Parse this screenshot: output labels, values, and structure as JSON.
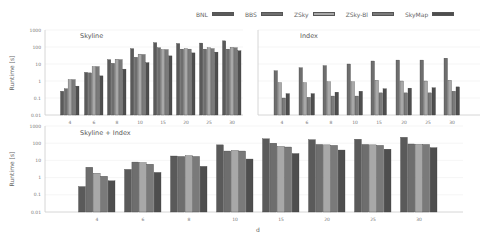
{
  "legend": [
    {
      "name": "BNL",
      "color": "#5a5a5a"
    },
    {
      "name": "BBS",
      "color": "#6e6e6e"
    },
    {
      "name": "ZSky",
      "color": "#a8a8a8"
    },
    {
      "name": "ZSky-Bl",
      "color": "#7a7a7a"
    },
    {
      "name": "SkyMap",
      "color": "#4e4e4e"
    }
  ],
  "chart_data": [
    {
      "type": "bar",
      "title": "Skyline",
      "xlabel": "",
      "ylabel": "Runtime [s]",
      "yscale": "log",
      "ylim": [
        0.01,
        1000
      ],
      "yticks": [
        "1000",
        "100",
        "10",
        "1",
        "0.1",
        "0.01"
      ],
      "grid": true,
      "categories": [
        "4",
        "6",
        "8",
        "10",
        "15",
        "20",
        "25",
        "30"
      ],
      "series": [
        {
          "name": "BNL",
          "values": [
            0.25,
            3.2,
            18,
            80,
            180,
            160,
            170,
            230
          ]
        },
        {
          "name": "BBS",
          "values": [
            0.35,
            3.0,
            11,
            25,
            90,
            75,
            75,
            75
          ]
        },
        {
          "name": "ZSky",
          "values": [
            1.2,
            7,
            19,
            38,
            70,
            80,
            90,
            95
          ]
        },
        {
          "name": "ZSky-Bl",
          "values": [
            1.2,
            7,
            18,
            36,
            70,
            75,
            80,
            90
          ]
        },
        {
          "name": "SkyMap",
          "values": [
            0.5,
            2,
            5,
            12,
            30,
            45,
            50,
            60
          ]
        }
      ]
    },
    {
      "type": "bar",
      "title": "Index",
      "xlabel": "",
      "ylabel": "",
      "yscale": "log",
      "ylim": [
        0.01,
        1000
      ],
      "grid": true,
      "categories": [
        "4",
        "6",
        "8",
        "10",
        "15",
        "20",
        "25",
        "30"
      ],
      "series": [
        {
          "name": "BBS",
          "values": [
            4,
            6,
            8,
            10,
            15,
            17,
            17,
            22
          ]
        },
        {
          "name": "ZSky",
          "values": [
            0.8,
            0.8,
            0.9,
            0.9,
            1.1,
            1.0,
            1.0,
            1.1
          ]
        },
        {
          "name": "ZSky-Bl",
          "values": [
            0.1,
            0.11,
            0.13,
            0.13,
            0.2,
            0.2,
            0.2,
            0.25
          ]
        },
        {
          "name": "SkyMap",
          "values": [
            0.18,
            0.18,
            0.22,
            0.25,
            0.35,
            0.38,
            0.4,
            0.45
          ]
        }
      ]
    },
    {
      "type": "bar",
      "title": "Skyline + Index",
      "xlabel": "d",
      "ylabel": "Runtime [s]",
      "yscale": "log",
      "ylim": [
        0.01,
        1000
      ],
      "yticks": [
        "1000",
        "100",
        "10",
        "1",
        "0.1",
        "0.01"
      ],
      "grid": true,
      "categories": [
        "4",
        "6",
        "8",
        "10",
        "15",
        "20",
        "25",
        "30"
      ],
      "series": [
        {
          "name": "BNL",
          "values": [
            0.3,
            3,
            18,
            80,
            180,
            160,
            170,
            220
          ]
        },
        {
          "name": "BBS",
          "values": [
            4,
            8,
            17,
            35,
            100,
            85,
            85,
            90
          ]
        },
        {
          "name": "ZSky",
          "values": [
            1.8,
            7.5,
            19,
            38,
            65,
            80,
            80,
            85
          ]
        },
        {
          "name": "ZSky-Bl",
          "values": [
            1.2,
            6,
            17,
            35,
            60,
            75,
            75,
            85
          ]
        },
        {
          "name": "SkyMap",
          "values": [
            0.65,
            2,
            4.5,
            12,
            25,
            40,
            45,
            55
          ]
        }
      ]
    }
  ]
}
